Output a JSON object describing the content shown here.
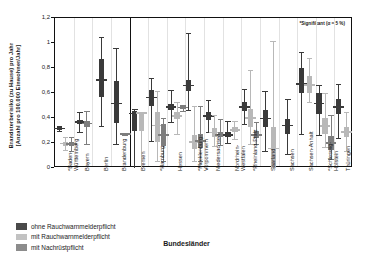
{
  "chart_data": {
    "type": "bar",
    "title": "",
    "ylabel_line1": "Brandsterberisiko (zu Hause) pro Jahr",
    "ylabel_line2": "[Anzahl pro 100.000 Einwohner/Jahr]",
    "xlabel": "Bundesländer",
    "ylim": [
      0,
      1.2
    ],
    "yticks": [
      "0",
      "0,2",
      "0,4",
      "0,6",
      "0,8",
      "1",
      "1,2"
    ],
    "ytick_values": [
      0,
      0.2,
      0.4,
      0.6,
      0.8,
      1.0,
      1.2
    ],
    "grid": "vertical-light",
    "legend_position": "below-left",
    "annotation": "*Signifikant (α = 5 %)",
    "group_separator_after": "Brandenburg",
    "series": [
      {
        "name": "ohne Rauchwarnmelderpflicht",
        "color": "#3a3a3a"
      },
      {
        "name": "mit Rauchwarnmelderpflicht",
        "color": "#b8b8b8"
      },
      {
        "name": "mit Nachrüstpflicht",
        "color": "#7d7d7d"
      }
    ],
    "categories": [
      "*Baden-Württemberg",
      "Bayern",
      "Berlin",
      "Brandenburg",
      "Bremen",
      "*Hamburg",
      "Hessen",
      "*Mecklenburg-Vorpommern",
      "Niedersachsen",
      "Nordrhein-Westfalen",
      "*Rheinland-Pfalz",
      "Saarland",
      "Sachsen",
      "Sachsen-Anhalt",
      "*Schleswig-Holstein",
      "Thüringen"
    ],
    "groups": [
      {
        "category": "*Baden-Württemberg",
        "label_lines": [
          "*Baden-",
          "Württemberg"
        ],
        "boxes": [
          {
            "series": 0,
            "low": 0.3,
            "q1": 0.305,
            "med": 0.315,
            "q3": 0.325,
            "high": 0.335,
            "offset": -5
          },
          {
            "series": 1,
            "low": 0.145,
            "q1": 0.18,
            "med": 0.195,
            "q3": 0.21,
            "high": 0.245,
            "offset": 1
          },
          {
            "series": 2,
            "low": 0.135,
            "q1": 0.175,
            "med": 0.19,
            "q3": 0.205,
            "high": 0.245,
            "offset": 7
          }
        ]
      },
      {
        "category": "Bayern",
        "label_lines": [
          "Bayern"
        ],
        "boxes": [
          {
            "series": 0,
            "low": 0.29,
            "q1": 0.355,
            "med": 0.37,
            "q3": 0.385,
            "high": 0.445,
            "offset": -3
          },
          {
            "series": 2,
            "low": 0.195,
            "q1": 0.33,
            "med": 0.355,
            "q3": 0.375,
            "high": 0.455,
            "offset": 4
          }
        ]
      },
      {
        "category": "Berlin",
        "label_lines": [
          "Berlin"
        ],
        "boxes": [
          {
            "series": 0,
            "low": 0.335,
            "q1": 0.565,
            "med": 0.705,
            "q3": 0.875,
            "high": 1.05,
            "offset": 0
          }
        ]
      },
      {
        "category": "Brandenburg",
        "label_lines": [
          "Brandenburg"
        ],
        "boxes": [
          {
            "series": 0,
            "low": 0.19,
            "q1": 0.36,
            "med": 0.515,
            "q3": 0.695,
            "high": 0.96,
            "offset": -4
          },
          {
            "series": 2,
            "low": 0.265,
            "q1": 0.265,
            "med": 0.27,
            "q3": 0.275,
            "high": 0.275,
            "offset": 5
          }
        ]
      },
      {
        "category": "Bremen",
        "label_lines": [
          "Bremen"
        ],
        "boxes": [
          {
            "series": 0,
            "low": 0.0,
            "q1": 0.3,
            "med": 0.435,
            "q3": 0.455,
            "high": 0.47,
            "offset": -4
          },
          {
            "series": 1,
            "low": 0.0,
            "q1": 0.3,
            "med": 0.44,
            "q3": 0.445,
            "high": 0.45,
            "offset": 3
          }
        ]
      },
      {
        "category": "*Hamburg",
        "label_lines": [
          "*Hamburg"
        ],
        "boxes": [
          {
            "series": 0,
            "low": 0.22,
            "q1": 0.5,
            "med": 0.565,
            "q3": 0.625,
            "high": 0.72,
            "offset": -6
          },
          {
            "series": 1,
            "low": 0.06,
            "q1": 0.21,
            "med": 0.34,
            "q3": 0.45,
            "high": 0.62,
            "offset": 0
          },
          {
            "series": 2,
            "low": 0.06,
            "q1": 0.175,
            "med": 0.265,
            "q3": 0.35,
            "high": 0.4,
            "offset": 6
          }
        ]
      },
      {
        "category": "Hessen",
        "label_lines": [
          "Hessen"
        ],
        "boxes": [
          {
            "series": 0,
            "low": 0.37,
            "q1": 0.465,
            "med": 0.49,
            "q3": 0.515,
            "high": 0.625,
            "offset": -5
          },
          {
            "series": 1,
            "low": 0.275,
            "q1": 0.39,
            "med": 0.415,
            "q3": 0.445,
            "high": 0.53,
            "offset": 1
          },
          {
            "series": 2,
            "low": 0.46,
            "q1": 0.475,
            "med": 0.485,
            "q3": 0.495,
            "high": 0.505,
            "offset": 7
          }
        ]
      },
      {
        "category": "*Mecklenburg-Vorpommern",
        "label_lines": [
          "*Mecklenburg-",
          "Vorpommern"
        ],
        "boxes": [
          {
            "series": 0,
            "low": 0.465,
            "q1": 0.615,
            "med": 0.66,
            "q3": 0.705,
            "high": 1.08,
            "offset": -6
          },
          {
            "series": 1,
            "low": 0.06,
            "q1": 0.155,
            "med": 0.21,
            "q3": 0.265,
            "high": 0.5,
            "offset": 0
          },
          {
            "series": 2,
            "low": 0.06,
            "q1": 0.16,
            "med": 0.215,
            "q3": 0.27,
            "high": 0.5,
            "offset": 6
          }
        ]
      },
      {
        "category": "Niedersachsen",
        "label_lines": [
          "Niedersachsen"
        ],
        "boxes": [
          {
            "series": 0,
            "low": 0.285,
            "q1": 0.385,
            "med": 0.415,
            "q3": 0.445,
            "high": 0.545,
            "offset": -5
          },
          {
            "series": 1,
            "low": 0.175,
            "q1": 0.245,
            "med": 0.285,
            "q3": 0.32,
            "high": 0.425,
            "offset": 1
          },
          {
            "series": 2,
            "low": 0.185,
            "q1": 0.245,
            "med": 0.265,
            "q3": 0.285,
            "high": 0.39,
            "offset": 7
          }
        ]
      },
      {
        "category": "Nordrhein-Westfalen",
        "label_lines": [
          "Nordrhein-",
          "Westfalen"
        ],
        "boxes": [
          {
            "series": 0,
            "low": 0.2,
            "q1": 0.245,
            "med": 0.265,
            "q3": 0.285,
            "high": 0.38,
            "offset": -4
          },
          {
            "series": 1,
            "low": 0.235,
            "q1": 0.285,
            "med": 0.305,
            "q3": 0.325,
            "high": 0.375,
            "offset": 3
          }
        ]
      },
      {
        "category": "*Rheinland-Pfalz",
        "label_lines": [
          "*Rheinland-Pfalz"
        ],
        "boxes": [
          {
            "series": 0,
            "low": 0.355,
            "q1": 0.455,
            "med": 0.49,
            "q3": 0.525,
            "high": 0.635,
            "offset": -6
          },
          {
            "series": 1,
            "low": 0.19,
            "q1": 0.325,
            "med": 0.4,
            "q3": 0.47,
            "high": 0.785,
            "offset": 0
          },
          {
            "series": 2,
            "low": 0.19,
            "q1": 0.24,
            "med": 0.265,
            "q3": 0.295,
            "high": 0.37,
            "offset": 6
          }
        ]
      },
      {
        "category": "Saarland",
        "label_lines": [
          "Saarland"
        ],
        "boxes": [
          {
            "series": 0,
            "low": 0.14,
            "q1": 0.33,
            "med": 0.395,
            "q3": 0.465,
            "high": 0.62,
            "offset": -4
          },
          {
            "series": 1,
            "low": 0.0,
            "q1": 0.0,
            "med": 0.155,
            "q3": 0.325,
            "high": 1.015,
            "offset": 4
          }
        ]
      },
      {
        "category": "Sachsen",
        "label_lines": [
          "Sachsen"
        ],
        "boxes": [
          {
            "series": 0,
            "low": 0.115,
            "q1": 0.275,
            "med": 0.34,
            "q3": 0.39,
            "high": 0.55,
            "offset": 0
          }
        ]
      },
      {
        "category": "Sachsen-Anhalt",
        "label_lines": [
          "Sachsen-Anhalt"
        ],
        "boxes": [
          {
            "series": 0,
            "low": 0.275,
            "q1": 0.6,
            "med": 0.67,
            "q3": 0.8,
            "high": 0.93,
            "offset": -5
          },
          {
            "series": 1,
            "low": 0.525,
            "q1": 0.6,
            "med": 0.665,
            "q3": 0.735,
            "high": 0.88,
            "offset": 3
          }
        ]
      },
      {
        "category": "*Schleswig-Holstein",
        "label_lines": [
          "*Schleswig-",
          "Holstein"
        ],
        "boxes": [
          {
            "series": 0,
            "low": 0.265,
            "q1": 0.435,
            "med": 0.515,
            "q3": 0.6,
            "high": 0.665,
            "offset": -6
          },
          {
            "series": 1,
            "low": 0.165,
            "q1": 0.275,
            "med": 0.335,
            "q3": 0.4,
            "high": 0.6,
            "offset": 0
          },
          {
            "series": 2,
            "low": 0.07,
            "q1": 0.145,
            "med": 0.2,
            "q3": 0.255,
            "high": 0.425,
            "offset": 6
          }
        ]
      },
      {
        "category": "Thüringen",
        "label_lines": [
          "Thüringen"
        ],
        "boxes": [
          {
            "series": 0,
            "low": 0.24,
            "q1": 0.435,
            "med": 0.49,
            "q3": 0.55,
            "high": 0.675,
            "offset": -5
          },
          {
            "series": 1,
            "low": 0.135,
            "q1": 0.245,
            "med": 0.29,
            "q3": 0.33,
            "high": 0.45,
            "offset": 3
          }
        ]
      }
    ]
  },
  "legend": {
    "items": [
      {
        "label": "ohne Rauchwarnmelderpflicht",
        "color": "#4a4a4a"
      },
      {
        "label": "mit Rauchwarnmelderpflicht",
        "color": "#c2c2c2"
      },
      {
        "label": "mit Nachrüstpflicht",
        "color": "#8c8c8c"
      }
    ]
  }
}
